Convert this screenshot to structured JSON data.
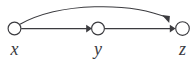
{
  "diagram": {
    "kind": "directed-acyclic-graph",
    "background_color": "#ffffff",
    "stroke_color": "#3b3b3f",
    "canvas": {
      "width": 195,
      "height": 69
    },
    "nodes": [
      {
        "id": "x",
        "label": "x",
        "shape": "circle",
        "cx": 14.5,
        "cy": 28.5,
        "r": 6.4,
        "label_x": 14.5,
        "label_y": 40
      },
      {
        "id": "y",
        "label": "y",
        "shape": "circle",
        "cx": 98.0,
        "cy": 28.5,
        "r": 6.4,
        "label_x": 98.0,
        "label_y": 40
      },
      {
        "id": "z",
        "label": "z",
        "shape": "circle",
        "cx": 182.5,
        "cy": 28.5,
        "r": 6.8,
        "label_x": 182.5,
        "label_y": 40
      }
    ],
    "edges": [
      {
        "id": "x-to-y",
        "from": "x",
        "to": "y",
        "style": "straight",
        "arrow": "end",
        "path": "M 21.2,28.6 L 87.8,28.6",
        "arrow_points": "86.2,24.8 92.0,28.6 86.2,32.4"
      },
      {
        "id": "y-to-z",
        "from": "y",
        "to": "z",
        "style": "straight",
        "arrow": "end",
        "path": "M 104.6,28.6 L 171.4,28.6",
        "arrow_points": "169.8,24.8 175.6,28.6 169.8,32.4"
      },
      {
        "id": "x-to-z",
        "from": "x",
        "to": "z",
        "style": "curved-arc",
        "arrow": "end",
        "path": "M 20.0,24.2 C 60.0,2.2 130.0,2.0 167.0,17.6",
        "arrow_points": "169.2,22.9 161.9,14.9 169.9,16.1"
      }
    ],
    "labels": {
      "x": "x",
      "y": "y",
      "z": "z"
    }
  }
}
